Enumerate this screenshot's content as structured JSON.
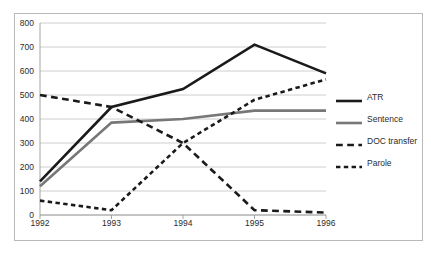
{
  "chart_data": {
    "type": "line",
    "title": "",
    "xlabel": "",
    "ylabel": "",
    "x": [
      "1992",
      "1993",
      "1994",
      "1995",
      "1996"
    ],
    "categories": [
      "1992",
      "1993",
      "1994",
      "1995",
      "1996"
    ],
    "ylim": [
      0,
      800
    ],
    "y_ticks": [
      0,
      100,
      200,
      300,
      400,
      500,
      600,
      700,
      800
    ],
    "y_tick_labels": [
      "0",
      "100",
      "200",
      "300",
      "400",
      "500",
      "600",
      "700",
      "800"
    ],
    "grid": true,
    "legend_position": "right",
    "series": [
      {
        "name": "ATR",
        "values": [
          140,
          450,
          525,
          710,
          590
        ],
        "color": "#1a1a1a",
        "style": "solid",
        "width": 2.6
      },
      {
        "name": "Sentence",
        "values": [
          120,
          385,
          400,
          435,
          435
        ],
        "color": "#777777",
        "style": "solid",
        "width": 2.6
      },
      {
        "name": "DOC transfer",
        "values": [
          500,
          450,
          300,
          20,
          10
        ],
        "color": "#1a1a1a",
        "style": "long-dash",
        "width": 2.6
      },
      {
        "name": "Parole",
        "values": [
          60,
          20,
          300,
          480,
          565
        ],
        "color": "#1a1a1a",
        "style": "short-dash",
        "width": 2.6
      }
    ]
  },
  "legend": {
    "items": [
      {
        "label": "ATR"
      },
      {
        "label": "Sentence"
      },
      {
        "label": "DOC transfer"
      },
      {
        "label": "Parole"
      }
    ]
  }
}
